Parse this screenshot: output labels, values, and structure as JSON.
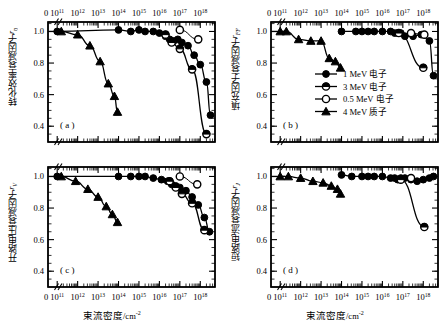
{
  "figure": {
    "xaxis_title": "束流密度",
    "xaxis_unit": "/cm",
    "xaxis_unit_exp": "-2",
    "xtick_zero": "0",
    "xtick_exponents": [
      "11",
      "12",
      "13",
      "14",
      "15",
      "16",
      "17",
      "18"
    ],
    "xtick_mantissa": "10",
    "ytick_labels": [
      "1.0",
      "0.8",
      "0.6",
      "0.4"
    ]
  },
  "legend": {
    "items": [
      {
        "label": "1 MeV 电子",
        "marker": "filled-circle"
      },
      {
        "label": "3 MeV 电子",
        "marker": "half-circle"
      },
      {
        "label": "0.5 MeV 电子",
        "marker": "open-circle"
      },
      {
        "label": "4 MeV 质子",
        "marker": "filled-triangle"
      }
    ]
  },
  "panels": {
    "a": {
      "letter": "( a )",
      "ylabel_cn": "转化效率衰减因子",
      "ylabel_sym": "r",
      "ylabel_sub": "η"
    },
    "b": {
      "letter": "( b )",
      "ylabel_cn": "填充因子衰减因子",
      "ylabel_sym": "r",
      "ylabel_sub": "FF"
    },
    "c": {
      "letter": "( c )",
      "ylabel_cn": "开路电压衰减因子",
      "ylabel_sym": "r",
      "ylabel_sub": "V"
    },
    "d": {
      "letter": "( d )",
      "ylabel_cn": "短路电流衰减因子",
      "ylabel_sym": "r",
      "ylabel_sub": "J"
    }
  },
  "chart_data": [
    {
      "id": "a",
      "type": "scatter",
      "title": "",
      "xlabel": "束流密度/cm-2",
      "ylabel": "转化效率衰减因子 r_η",
      "xscale": "log",
      "xlim": [
        11,
        18.6
      ],
      "ylim": [
        0.3,
        1.06
      ],
      "yticks": [
        1.0,
        0.8,
        0.6,
        0.4
      ],
      "grid": false,
      "series": [
        {
          "name": "1 MeV 电子",
          "marker": "filled-circle",
          "x": [
            11.0,
            14.0,
            14.6,
            15.0,
            15.3,
            15.7,
            16.0,
            16.3,
            16.5,
            16.7,
            16.9,
            17.1,
            17.4,
            17.7,
            18.0,
            18.3,
            18.5
          ],
          "y": [
            1.0,
            1.01,
            1.0,
            1.01,
            1.0,
            1.0,
            0.99,
            0.97,
            0.95,
            0.94,
            0.95,
            0.93,
            0.91,
            0.85,
            0.79,
            0.68,
            0.47
          ]
        },
        {
          "name": "3 MeV 电子",
          "marker": "half-circle",
          "x": [
            16.3,
            16.6,
            17.0,
            17.6,
            18.3
          ],
          "y": [
            0.98,
            0.93,
            0.89,
            0.76,
            0.35
          ]
        },
        {
          "name": "0.5 MeV 电子",
          "marker": "open-circle",
          "x": [
            17.0,
            17.9
          ],
          "y": [
            1.01,
            0.95
          ]
        },
        {
          "name": "4 MeV 质子",
          "marker": "filled-triangle",
          "x": [
            11.2,
            12.0,
            12.6,
            13.1,
            13.5,
            13.8,
            13.95
          ],
          "y": [
            1.0,
            0.98,
            0.91,
            0.81,
            0.67,
            0.59,
            0.49
          ]
        }
      ]
    },
    {
      "id": "b",
      "type": "scatter",
      "title": "",
      "xlabel": "束流密度/cm-2",
      "ylabel": "填充因子衰减因子 r_FF",
      "xscale": "log",
      "xlim": [
        11,
        18.6
      ],
      "ylim": [
        0.3,
        1.06
      ],
      "yticks": [
        1.0,
        0.8,
        0.6,
        0.4
      ],
      "grid": false,
      "series": [
        {
          "name": "1 MeV 电子",
          "marker": "filled-circle",
          "x": [
            14.0,
            14.7,
            15.0,
            15.3,
            15.6,
            16.0,
            16.4,
            16.6,
            16.75,
            16.9,
            17.1,
            17.5,
            17.9,
            18.3,
            18.5
          ],
          "y": [
            1.0,
            1.0,
            1.0,
            1.0,
            1.0,
            1.0,
            1.0,
            0.99,
            0.99,
            0.99,
            0.97,
            0.97,
            0.98,
            0.94,
            0.72
          ]
        },
        {
          "name": "3 MeV 电子",
          "marker": "half-circle",
          "x": [
            16.8,
            18.0
          ],
          "y": [
            0.99,
            0.77
          ]
        },
        {
          "name": "0.5 MeV 电子",
          "marker": "open-circle",
          "x": [
            17.4,
            18.05
          ],
          "y": [
            0.99,
            0.98
          ]
        },
        {
          "name": "4 MeV 质子",
          "marker": "filled-triangle",
          "x": [
            11.0,
            11.3,
            11.9,
            12.5,
            13.0,
            13.4,
            13.7,
            13.95
          ],
          "y": [
            1.0,
            1.0,
            0.95,
            0.94,
            0.94,
            0.83,
            0.81,
            0.77
          ]
        }
      ]
    },
    {
      "id": "c",
      "type": "scatter",
      "title": "",
      "xlabel": "束流密度/cm-2",
      "ylabel": "开路电压衰减因子 r_V",
      "xscale": "log",
      "xlim": [
        11,
        18.6
      ],
      "ylim": [
        0.3,
        1.06
      ],
      "yticks": [
        1.0,
        0.8,
        0.6,
        0.4
      ],
      "grid": false,
      "series": [
        {
          "name": "1 MeV 电子",
          "marker": "filled-circle",
          "x": [
            11.0,
            14.0,
            14.6,
            15.0,
            15.3,
            15.7,
            16.1,
            16.4,
            16.6,
            16.8,
            17.0,
            17.3,
            17.6,
            17.9,
            18.2,
            18.45
          ],
          "y": [
            1.0,
            1.0,
            1.0,
            1.0,
            1.0,
            0.99,
            0.98,
            0.97,
            0.95,
            0.94,
            0.93,
            0.91,
            0.87,
            0.82,
            0.74,
            0.65
          ]
        },
        {
          "name": "3 MeV 电子",
          "marker": "half-circle",
          "x": [
            16.5,
            16.8,
            17.1,
            17.6,
            18.2
          ],
          "y": [
            0.97,
            0.93,
            0.89,
            0.83,
            0.66
          ]
        },
        {
          "name": "0.5 MeV 电子",
          "marker": "open-circle",
          "x": [
            17.0,
            17.85
          ],
          "y": [
            1.0,
            0.95
          ]
        },
        {
          "name": "4 MeV 质子",
          "marker": "filled-triangle",
          "x": [
            11.2,
            11.9,
            12.5,
            13.0,
            13.4,
            13.7,
            13.95
          ],
          "y": [
            1.0,
            0.97,
            0.92,
            0.87,
            0.81,
            0.76,
            0.71
          ]
        }
      ]
    },
    {
      "id": "d",
      "type": "scatter",
      "title": "",
      "xlabel": "束流密度/cm-2",
      "ylabel": "短路电流衰减因子 r_J",
      "xscale": "log",
      "xlim": [
        11,
        18.6
      ],
      "ylim": [
        0.3,
        1.06
      ],
      "yticks": [
        1.0,
        0.8,
        0.6,
        0.4
      ],
      "grid": false,
      "series": [
        {
          "name": "1 MeV 电子",
          "marker": "filled-circle",
          "x": [
            14.0,
            14.5,
            15.0,
            15.3,
            15.6,
            16.0,
            16.4,
            16.6,
            16.75,
            16.9,
            17.1,
            17.4,
            17.7,
            18.0,
            18.3,
            18.5
          ],
          "y": [
            1.01,
            1.0,
            1.0,
            1.0,
            1.0,
            1.0,
            0.99,
            0.99,
            0.98,
            0.99,
            0.99,
            0.98,
            0.97,
            0.98,
            0.99,
            1.0
          ]
        },
        {
          "name": "3 MeV 电子",
          "marker": "half-circle",
          "x": [
            16.9,
            18.05
          ],
          "y": [
            0.98,
            0.68
          ]
        },
        {
          "name": "0.5 MeV 电子",
          "marker": "open-circle",
          "x": [
            17.4
          ],
          "y": [
            0.99
          ]
        },
        {
          "name": "4 MeV 质子",
          "marker": "filled-triangle",
          "x": [
            11.0,
            11.4,
            12.0,
            12.6,
            13.1,
            13.5,
            13.8,
            13.95
          ],
          "y": [
            1.0,
            1.0,
            0.99,
            0.97,
            0.96,
            0.94,
            0.92,
            0.89
          ]
        }
      ]
    }
  ]
}
